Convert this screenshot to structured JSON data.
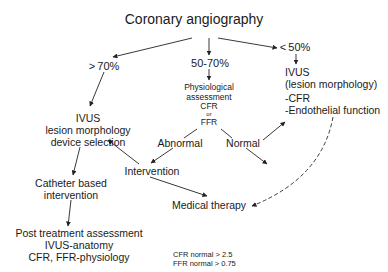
{
  "title": "Coronary angiography",
  "branches": {
    "severe": "> 70%",
    "intermediate": "50-70%",
    "mild": "< 50%"
  },
  "physiological": {
    "line1": "Physiological",
    "line2": "assessment",
    "line3": "CFR",
    "line4": "or",
    "line5": "FFR"
  },
  "results": {
    "abnormal": "Abnormal",
    "normal": "Normal"
  },
  "ivus_left": {
    "line1": "IVUS",
    "line2": "lesion morphology",
    "line3": "device selection"
  },
  "ivus_right": {
    "line1": "IVUS",
    "line2": "(lesion morphology)",
    "line3": "-CFR",
    "line4": "-Endothelial function"
  },
  "intervention": "Intervention",
  "catheter": {
    "line1": "Catheter based",
    "line2": "intervention"
  },
  "medical_therapy": "Medical therapy",
  "post_treatment": {
    "line1": "Post treatment assessment",
    "line2": "IVUS-anatomy",
    "line3": "CFR, FFR-physiology"
  },
  "legend": {
    "cfr": "CFR normal  > 2.5",
    "ffr": "FFR normal  > 0.75"
  },
  "colors": {
    "text": "#1a1a1a",
    "line": "#222222",
    "background": "#ffffff"
  }
}
